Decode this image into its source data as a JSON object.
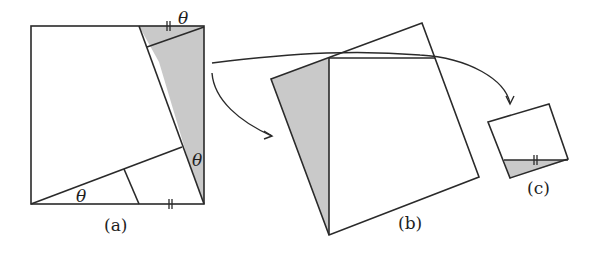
{
  "figures": [
    {
      "id": "a",
      "label": "(a)",
      "angle_labels": [
        "θ",
        "θ",
        "θ"
      ],
      "tick_marks": "||"
    },
    {
      "id": "b",
      "label": "(b)"
    },
    {
      "id": "c",
      "label": "(c)",
      "tick_marks": "||"
    }
  ],
  "colors": {
    "stroke": "#2a2a2a",
    "shade": "#c9c9c9",
    "background": "#ffffff"
  }
}
